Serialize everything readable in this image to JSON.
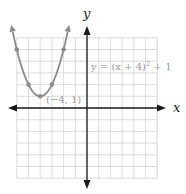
{
  "chart_data": {
    "type": "line",
    "title": "",
    "xlabel": "x",
    "ylabel": "y",
    "xlim": [
      -6,
      6
    ],
    "ylim": [
      -6,
      6
    ],
    "grid": true,
    "tick_labels": false,
    "series": [
      {
        "name": "y = (x + 4)^2 + 1",
        "function": "(x+4)^2+1",
        "x": [
          -6,
          -5,
          -4,
          -3,
          -2
        ],
        "y": [
          5,
          2,
          1,
          2,
          5
        ],
        "marked_points": [
          [
            -6,
            5
          ],
          [
            -5,
            2
          ],
          [
            -4,
            1
          ],
          [
            -3,
            2
          ],
          [
            -2,
            5
          ]
        ],
        "arrows_at_ends": true,
        "color": "#8c8c8c"
      }
    ],
    "annotations": [
      {
        "text": "y = (x + 4)² + 1",
        "at": [
          0.5,
          4
        ]
      },
      {
        "text": "(−4, 1)",
        "at": [
          -4,
          1
        ]
      }
    ]
  },
  "labels": {
    "x_axis": "x",
    "y_axis": "y",
    "equation_main": "y = (x + 4)",
    "equation_exp": "2",
    "equation_tail": " + 1",
    "vertex": "(−4, 1)"
  },
  "colors": {
    "axis": "#1a1a1a",
    "grid": "#d4d4d4",
    "grid_border": "#c8c8c8",
    "curve": "#8c8c8c",
    "label": "#9a9a9a"
  }
}
